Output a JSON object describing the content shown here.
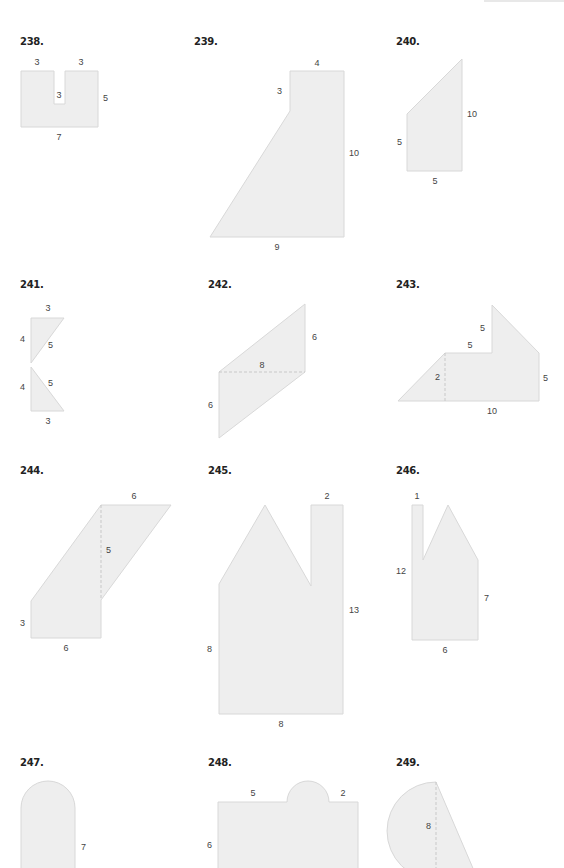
{
  "page": {
    "section": "Composite figures",
    "problems": [
      {
        "number": "238.",
        "labels": [
          "3",
          "3",
          "3",
          "5",
          "7"
        ]
      },
      {
        "number": "239.",
        "labels": [
          "4",
          "3",
          "10",
          "9"
        ]
      },
      {
        "number": "240.",
        "labels": [
          "10",
          "5",
          "5"
        ]
      },
      {
        "number": "241.",
        "labels": [
          "3",
          "4",
          "5",
          "4",
          "5",
          "3"
        ]
      },
      {
        "number": "242.",
        "labels": [
          "6",
          "8",
          "6"
        ]
      },
      {
        "number": "243.",
        "labels": [
          "5",
          "5",
          "2",
          "5",
          "10"
        ]
      },
      {
        "number": "244.",
        "labels": [
          "6",
          "5",
          "3",
          "6"
        ]
      },
      {
        "number": "245.",
        "labels": [
          "2",
          "13",
          "8",
          "8"
        ]
      },
      {
        "number": "246.",
        "labels": [
          "1",
          "12",
          "7",
          "6"
        ]
      },
      {
        "number": "247.",
        "labels": [
          "7"
        ]
      },
      {
        "number": "248.",
        "labels": [
          "5",
          "2",
          "6"
        ]
      },
      {
        "number": "249.",
        "labels": [
          "8"
        ]
      }
    ]
  }
}
